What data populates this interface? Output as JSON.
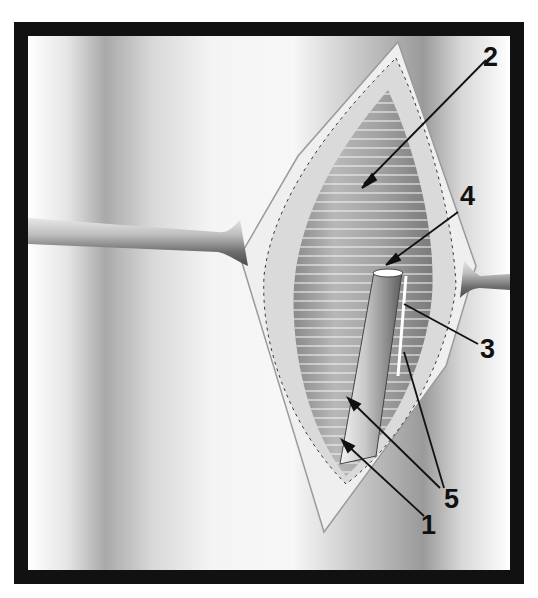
{
  "figure": {
    "type": "surgical-illustration",
    "frame_color": "#111111",
    "background_color": "#ffffff",
    "callouts": [
      {
        "id": "1",
        "label": "1"
      },
      {
        "id": "2",
        "label": "2"
      },
      {
        "id": "3",
        "label": "3"
      },
      {
        "id": "4",
        "label": "4"
      },
      {
        "id": "5",
        "label": "5"
      }
    ]
  }
}
